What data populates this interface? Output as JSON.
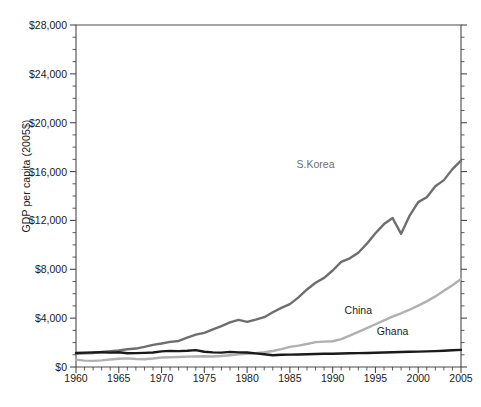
{
  "chart_data": {
    "type": "line",
    "title": "",
    "xlabel": "",
    "ylabel": "GDP per capita (2005$)",
    "xlim": [
      1960,
      2005
    ],
    "ylim": [
      0,
      28000
    ],
    "grid": false,
    "legend_position": "inline-annotation",
    "y_ticks": [
      0,
      4000,
      8000,
      12000,
      16000,
      20000,
      24000,
      28000
    ],
    "y_tick_labels": [
      "$0",
      "$4,000",
      "$8,000",
      "$12,000",
      "$16,000",
      "$20,000",
      "$24,000",
      "$28,000"
    ],
    "y_minor_tick_interval": 1000,
    "x_ticks": [
      1960,
      1965,
      1970,
      1975,
      1980,
      1985,
      1990,
      1995,
      2000,
      2005
    ],
    "x_tick_labels": [
      "1960",
      "1965",
      "1970",
      "1975",
      "1980",
      "1985",
      "1990",
      "1995",
      "2000",
      "2005"
    ],
    "x_minor_tick_interval": 1,
    "x": [
      1960,
      1961,
      1962,
      1963,
      1964,
      1965,
      1966,
      1967,
      1968,
      1969,
      1970,
      1971,
      1972,
      1973,
      1974,
      1975,
      1976,
      1977,
      1978,
      1979,
      1980,
      1981,
      1982,
      1983,
      1984,
      1985,
      1986,
      1987,
      1988,
      1989,
      1990,
      1991,
      1992,
      1993,
      1994,
      1995,
      1996,
      1997,
      1998,
      1999,
      2000,
      2001,
      2002,
      2003,
      2004,
      2005
    ],
    "series": [
      {
        "name": "S.Korea",
        "color": "#6e6e6e",
        "label_x": 1988,
        "label_y": 16600,
        "values": [
          1100,
          1130,
          1150,
          1230,
          1300,
          1360,
          1450,
          1510,
          1650,
          1810,
          1920,
          2060,
          2130,
          2400,
          2650,
          2800,
          3080,
          3350,
          3660,
          3860,
          3700,
          3880,
          4080,
          4480,
          4840,
          5150,
          5700,
          6350,
          6900,
          7300,
          7900,
          8600,
          8900,
          9350,
          10100,
          10950,
          11700,
          12200,
          10900,
          12400,
          13500,
          13900,
          14800,
          15300,
          16200,
          16900
        ]
      },
      {
        "name": "China",
        "color": "#b0b0b0",
        "label_x": 1993,
        "label_y": 4700,
        "values": [
          600,
          520,
          500,
          540,
          610,
          670,
          710,
          660,
          640,
          700,
          780,
          800,
          820,
          850,
          860,
          880,
          860,
          900,
          960,
          1030,
          1090,
          1130,
          1210,
          1310,
          1470,
          1650,
          1750,
          1880,
          2040,
          2080,
          2110,
          2280,
          2570,
          2880,
          3190,
          3500,
          3820,
          4130,
          4400,
          4690,
          5030,
          5370,
          5780,
          6240,
          6700,
          7200
        ]
      },
      {
        "name": "Ghana",
        "color": "#1a1a1a",
        "label_x": 1997,
        "label_y": 2950,
        "values": [
          1150,
          1180,
          1200,
          1210,
          1180,
          1210,
          1130,
          1140,
          1160,
          1190,
          1280,
          1320,
          1300,
          1330,
          1380,
          1250,
          1200,
          1180,
          1240,
          1200,
          1190,
          1120,
          1040,
          960,
          1000,
          1010,
          1020,
          1040,
          1060,
          1080,
          1090,
          1110,
          1120,
          1140,
          1150,
          1170,
          1190,
          1210,
          1230,
          1250,
          1260,
          1280,
          1300,
          1330,
          1370,
          1400
        ]
      }
    ]
  }
}
